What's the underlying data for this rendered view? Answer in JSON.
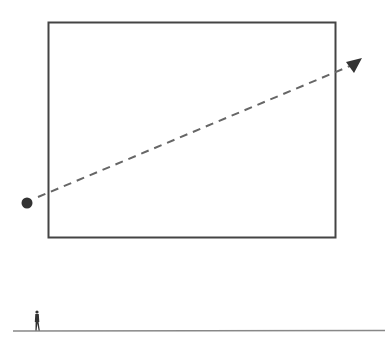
{
  "diagram": {
    "colors": {
      "background": "#ffffff",
      "rect_stroke": "#444444",
      "dash": "#666666",
      "marker": "#333333",
      "ground": "#888888",
      "figure": "#333333"
    },
    "elements": [
      {
        "type": "rectangle",
        "name": "frame-rectangle"
      },
      {
        "type": "dot",
        "name": "start-point"
      },
      {
        "type": "dashed-arrow",
        "name": "trajectory-arrow"
      },
      {
        "type": "line",
        "name": "ground-line"
      },
      {
        "type": "figure",
        "name": "human-figure-scale"
      }
    ]
  }
}
